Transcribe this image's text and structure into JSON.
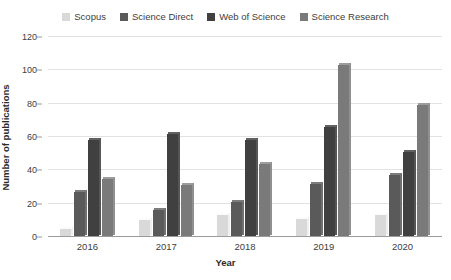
{
  "chart_data": {
    "type": "bar",
    "title": "",
    "subtitle": "",
    "xlabel": "Year",
    "ylabel": "Number of publications",
    "categories": [
      "2016",
      "2017",
      "2018",
      "2019",
      "2020"
    ],
    "series": [
      {
        "name": "Scopus",
        "values": [
          5,
          10,
          13,
          11,
          13
        ],
        "color": "#d9d9d9"
      },
      {
        "name": "Science Direct",
        "values": [
          27,
          16,
          21,
          32,
          37
        ],
        "color": "#5a5a5a"
      },
      {
        "name": "Web of Science",
        "values": [
          58,
          62,
          58,
          66,
          51
        ],
        "color": "#404040"
      },
      {
        "name": "Science Research",
        "values": [
          35,
          31,
          44,
          103,
          79
        ],
        "color": "#7a7a7a"
      }
    ],
    "ylim": [
      0,
      120
    ],
    "yticks": [
      0,
      20,
      40,
      60,
      80,
      100,
      120
    ],
    "ytick_labels": [
      "0",
      "20",
      "40",
      "60",
      "80",
      "100",
      "120"
    ],
    "grid": true,
    "legend_position": "top",
    "legend_entries": [
      "Scopus",
      "Science Direct",
      "Web of Science",
      "Science Research"
    ],
    "annotations": []
  },
  "axes": {
    "y_title": "Number of publications",
    "x_title": "Year"
  }
}
